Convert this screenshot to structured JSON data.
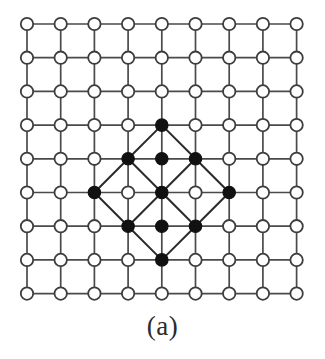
{
  "figure": {
    "caption": "(a)",
    "type": "lattice-diagram"
  },
  "chart_data": {
    "type": "scatter",
    "title": "",
    "subtitle": "",
    "xlabel": "",
    "ylabel": "",
    "grid": true,
    "legend": null,
    "xlim": [
      0,
      8
    ],
    "ylim": [
      0,
      8
    ],
    "grid_cols": 9,
    "grid_rows": 9,
    "tick_labels_x": [],
    "tick_labels_y": [],
    "annotations": [
      "(a)"
    ],
    "geometry": {
      "origin_x": 27,
      "origin_y": 24,
      "spacing": 33.7,
      "open_radius": 6.2,
      "filled_radius": 6.2
    },
    "colors": {
      "lattice_line": "#4a4a4a",
      "open_node_fill": "#ffffff",
      "open_node_stroke": "#3d3d3d",
      "filled_node_fill": "#111111",
      "diagonal_line": "#2a2a2a",
      "background": "#ffffff",
      "caption": "#2b2b2b"
    },
    "series": [
      {
        "name": "open sites",
        "marker": "open-circle",
        "points": [
          [
            0,
            0
          ],
          [
            1,
            0
          ],
          [
            2,
            0
          ],
          [
            3,
            0
          ],
          [
            4,
            0
          ],
          [
            5,
            0
          ],
          [
            6,
            0
          ],
          [
            7,
            0
          ],
          [
            8,
            0
          ],
          [
            0,
            1
          ],
          [
            1,
            1
          ],
          [
            2,
            1
          ],
          [
            3,
            1
          ],
          [
            4,
            1
          ],
          [
            5,
            1
          ],
          [
            6,
            1
          ],
          [
            7,
            1
          ],
          [
            8,
            1
          ],
          [
            0,
            2
          ],
          [
            1,
            2
          ],
          [
            2,
            2
          ],
          [
            3,
            2
          ],
          [
            4,
            2
          ],
          [
            5,
            2
          ],
          [
            6,
            2
          ],
          [
            7,
            2
          ],
          [
            8,
            2
          ],
          [
            0,
            3
          ],
          [
            1,
            3
          ],
          [
            2,
            3
          ],
          [
            3,
            3
          ],
          [
            5,
            3
          ],
          [
            6,
            3
          ],
          [
            7,
            3
          ],
          [
            8,
            3
          ],
          [
            0,
            4
          ],
          [
            1,
            4
          ],
          [
            2,
            4
          ],
          [
            6,
            4
          ],
          [
            7,
            4
          ],
          [
            8,
            4
          ],
          [
            0,
            5
          ],
          [
            1,
            5
          ],
          [
            3,
            5
          ],
          [
            5,
            5
          ],
          [
            7,
            5
          ],
          [
            8,
            5
          ],
          [
            0,
            6
          ],
          [
            1,
            6
          ],
          [
            2,
            6
          ],
          [
            6,
            6
          ],
          [
            7,
            6
          ],
          [
            8,
            6
          ],
          [
            0,
            7
          ],
          [
            1,
            7
          ],
          [
            2,
            7
          ],
          [
            3,
            7
          ],
          [
            5,
            7
          ],
          [
            6,
            7
          ],
          [
            7,
            7
          ],
          [
            8,
            7
          ],
          [
            0,
            8
          ],
          [
            1,
            8
          ],
          [
            2,
            8
          ],
          [
            3,
            8
          ],
          [
            4,
            8
          ],
          [
            5,
            8
          ],
          [
            6,
            8
          ],
          [
            7,
            8
          ],
          [
            8,
            8
          ]
        ]
      },
      {
        "name": "filled sites",
        "marker": "filled-circle",
        "points": [
          [
            4,
            3
          ],
          [
            3,
            4
          ],
          [
            4,
            4
          ],
          [
            5,
            4
          ],
          [
            2,
            5
          ],
          [
            4,
            5
          ],
          [
            6,
            5
          ],
          [
            3,
            6
          ],
          [
            4,
            6
          ],
          [
            5,
            6
          ],
          [
            4,
            7
          ]
        ]
      }
    ],
    "diagonal_edges": [
      [
        [
          4,
          3
        ],
        [
          3,
          4
        ]
      ],
      [
        [
          4,
          3
        ],
        [
          5,
          4
        ]
      ],
      [
        [
          3,
          4
        ],
        [
          2,
          5
        ]
      ],
      [
        [
          5,
          4
        ],
        [
          6,
          5
        ]
      ],
      [
        [
          2,
          5
        ],
        [
          3,
          6
        ]
      ],
      [
        [
          6,
          5
        ],
        [
          5,
          6
        ]
      ],
      [
        [
          3,
          6
        ],
        [
          4,
          7
        ]
      ],
      [
        [
          5,
          6
        ],
        [
          4,
          7
        ]
      ],
      [
        [
          4,
          5
        ],
        [
          3,
          4
        ]
      ],
      [
        [
          4,
          5
        ],
        [
          5,
          4
        ]
      ],
      [
        [
          4,
          5
        ],
        [
          3,
          6
        ]
      ],
      [
        [
          4,
          5
        ],
        [
          5,
          6
        ]
      ]
    ]
  }
}
